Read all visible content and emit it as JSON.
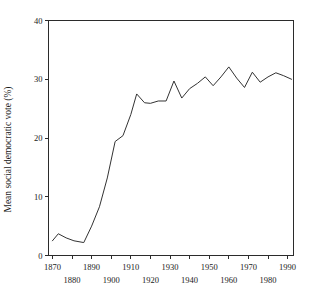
{
  "chart_data": {
    "type": "line",
    "title": "",
    "xlabel": "",
    "ylabel": "Mean social democratic vote (%)",
    "xlim": [
      1868,
      1993
    ],
    "ylim": [
      0,
      40
    ],
    "grid": false,
    "legend": null,
    "y_ticks": [
      0,
      10,
      20,
      30,
      40
    ],
    "y_tick_labels": [
      "0",
      "10",
      "20",
      "30",
      "40"
    ],
    "x_ticks": [
      1870,
      1880,
      1890,
      1900,
      1910,
      1920,
      1930,
      1940,
      1950,
      1960,
      1970,
      1980,
      1990
    ],
    "x_tick_labels_upper": [
      "1870",
      "1890",
      "1910",
      "1930",
      "1950",
      "1970",
      "1990"
    ],
    "x_tick_labels_lower": [
      "1880",
      "1900",
      "1920",
      "1940",
      "1960",
      "1980"
    ],
    "series": [
      {
        "name": "Mean social democratic vote",
        "color": "#333333",
        "x": [
          1870,
          1873,
          1877,
          1881,
          1886,
          1890,
          1894,
          1898,
          1902,
          1906,
          1910,
          1913,
          1917,
          1920,
          1924,
          1928,
          1932,
          1936,
          1940,
          1944,
          1948,
          1952,
          1956,
          1960,
          1964,
          1968,
          1972,
          1976,
          1980,
          1984,
          1988,
          1992
        ],
        "y": [
          2.5,
          3.7,
          3.0,
          2.5,
          2.2,
          5.0,
          8.3,
          13.2,
          19.4,
          20.4,
          24.0,
          27.5,
          26.0,
          25.9,
          26.3,
          26.3,
          29.7,
          26.8,
          28.4,
          29.3,
          30.4,
          28.9,
          30.4,
          32.1,
          30.2,
          28.6,
          31.2,
          29.5,
          30.4,
          31.1,
          30.6,
          30.0
        ]
      }
    ]
  },
  "axes": {
    "y_axis_title": "Mean social democratic vote (%)"
  },
  "caption": {
    "text": ""
  }
}
